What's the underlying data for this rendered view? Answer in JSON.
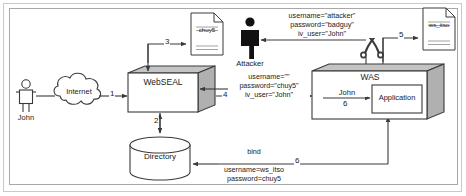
{
  "diagram": {
    "nodes": {
      "john": {
        "label": "John",
        "type": "person-icon"
      },
      "internet": {
        "label": "Internet",
        "type": "cloud"
      },
      "webseal": {
        "label": "WebSEAL",
        "type": "box3d"
      },
      "directory": {
        "label": "Directory",
        "type": "cylinder"
      },
      "attacker": {
        "label": "Attacker",
        "type": "person-icon-filled"
      },
      "was": {
        "label": "WAS",
        "type": "box3d"
      },
      "application": {
        "label": "Application",
        "type": "box"
      },
      "doc_chuy5": {
        "label": "chuy5",
        "type": "document"
      },
      "doc_ws_itso": {
        "label": "ws_itso",
        "type": "document"
      },
      "blocked": {
        "label": "",
        "type": "x-block-icon"
      }
    },
    "step_numbers": {
      "s1": "1",
      "s2": "2",
      "s3": "3",
      "s4": "4",
      "s5": "5",
      "s6_inner": "6",
      "s6_bind": "6"
    },
    "flow_labels": {
      "attacker_creds": {
        "line1": "username=\"attacker\"",
        "line2": "password=\"badguy\"",
        "line3": "iv_user=\"John\""
      },
      "webseal_creds": {
        "line1": "username=\"\"",
        "line2": "password=\"chuy5\"",
        "line3": "iv_user=\"John\""
      },
      "bind_creds": {
        "line1": "bind",
        "line2": "username=ws_itso",
        "line3": "password=chuy5"
      },
      "was_user": "John"
    },
    "colors": {
      "stroke": "#3a3a3a",
      "fill_face": "#ffffff",
      "fill_shadow": "#b5b5b5",
      "attacker_fill": "#111111",
      "frame_outer": "#c9c9c9",
      "frame_inner": "#a8a8a8",
      "text": "#1a1a1a"
    }
  }
}
